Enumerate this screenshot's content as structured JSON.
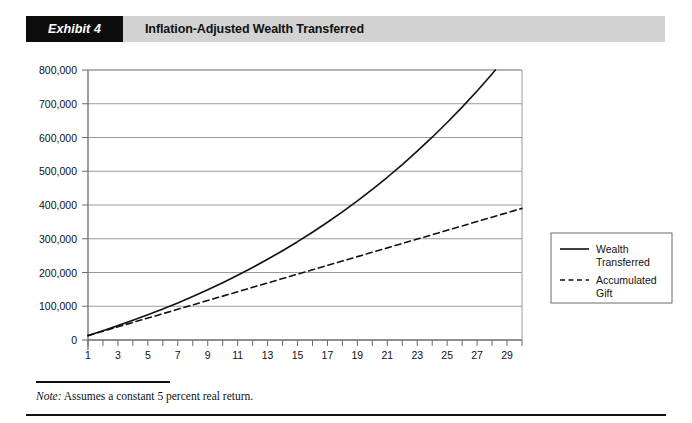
{
  "header": {
    "exhibit_tag": "Exhibit 4",
    "title": "Inflation-Adjusted Wealth Transferred",
    "tag_bg": "#0d0d0d",
    "bar_bg": "#d2d2d2"
  },
  "footer": {
    "note_lead": "Note:",
    "note_text": " Assumes a constant 5 percent real return."
  },
  "chart_data": {
    "type": "line",
    "title": "Inflation-Adjusted Wealth Transferred",
    "xlabel": "Years",
    "ylabel": "",
    "xlim": [
      1,
      30
    ],
    "ylim": [
      0,
      800000
    ],
    "grid": true,
    "grid_color": "#9a9a9a",
    "axis_color": "#6b6b6b",
    "legend_position": "right",
    "ytick_values": [
      0,
      100000,
      200000,
      300000,
      400000,
      500000,
      600000,
      700000,
      800000
    ],
    "ytick_labels": [
      "0",
      "100,000",
      "200,000",
      "300,000",
      "400,000",
      "500,000",
      "600,000",
      "700,000",
      "800,000"
    ],
    "xtick_values": [
      1,
      2,
      3,
      4,
      5,
      6,
      7,
      8,
      9,
      10,
      11,
      12,
      13,
      14,
      15,
      16,
      17,
      18,
      19,
      20,
      21,
      22,
      23,
      24,
      25,
      26,
      27,
      28,
      29,
      30
    ],
    "xtick_labels_shown": [
      "1",
      "3",
      "5",
      "7",
      "9",
      "11",
      "13",
      "15",
      "17",
      "19",
      "21",
      "23",
      "25",
      "27",
      "29"
    ],
    "x": [
      1,
      2,
      3,
      4,
      5,
      6,
      7,
      8,
      9,
      10,
      11,
      12,
      13,
      14,
      15,
      16,
      17,
      18,
      19,
      20,
      21,
      22,
      23,
      24,
      25,
      26,
      27,
      28,
      29,
      30
    ],
    "series": [
      {
        "name": "Wealth Transferred",
        "style": "solid",
        "color": "#111111",
        "values": [
          13500,
          27700,
          42600,
          58200,
          74600,
          91800,
          109900,
          128900,
          148900,
          169800,
          191800,
          214900,
          239200,
          264600,
          291300,
          319400,
          348800,
          379800,
          412300,
          446400,
          482200,
          519900,
          559400,
          600900,
          644400,
          690100,
          738000,
          788400,
          841300,
          896800
        ],
        "endpoint_value": 700000
      },
      {
        "name": "Accumulated Gift",
        "style": "dashed",
        "color": "#111111",
        "values": [
          13000,
          26000,
          39000,
          52000,
          65000,
          78000,
          91000,
          104000,
          117000,
          130000,
          143000,
          156000,
          169000,
          182000,
          195000,
          208000,
          221000,
          234000,
          247000,
          260000,
          273000,
          286000,
          299000,
          312000,
          325000,
          338000,
          351000,
          364000,
          377000,
          390000
        ],
        "endpoint_value": 390000
      }
    ],
    "legend": [
      {
        "label_line1": "Wealth",
        "label_line2": "Transferred",
        "style": "solid"
      },
      {
        "label_line1": "Accumulated",
        "label_line2": "Gift",
        "style": "dashed"
      }
    ],
    "note": "Assumes a constant 5 percent real return."
  }
}
